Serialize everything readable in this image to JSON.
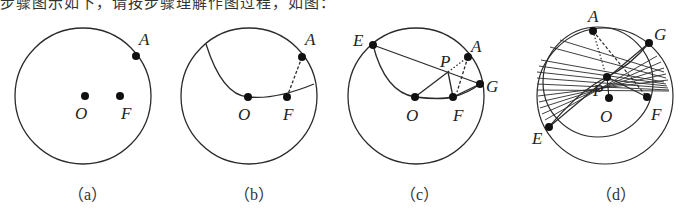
{
  "header": {
    "cropped_text": "步骤图示如下，请按步骤理解作图过程，如图："
  },
  "figures": [
    {
      "id": "a",
      "caption": "（a）",
      "points": {
        "A": "A",
        "O": "O",
        "F": "F"
      }
    },
    {
      "id": "b",
      "caption": "（b）",
      "points": {
        "A": "A",
        "O": "O",
        "F": "F"
      }
    },
    {
      "id": "c",
      "caption": "（c）",
      "points": {
        "E": "E",
        "P": "P",
        "A": "A",
        "G": "G",
        "O": "O",
        "F": "F"
      }
    },
    {
      "id": "d",
      "caption": "（d）",
      "points": {
        "A": "A",
        "G": "G",
        "P": "P",
        "O": "O",
        "F": "F",
        "E": "E"
      }
    }
  ],
  "colors": {
    "stroke": "#2a2a2a",
    "point": "#111111"
  }
}
